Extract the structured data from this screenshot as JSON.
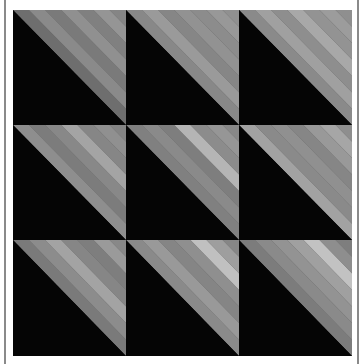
{
  "image": {
    "subject": "Quilt of half-square triangle blocks",
    "description": "3x3 grid of square blocks, each split diagonally from top-left to bottom-right; lower-left triangle solid black, upper-right triangle gray diagonal-striped fabric",
    "grid": {
      "rows": 3,
      "cols": 3
    },
    "colors": {
      "background": "#ffffff",
      "frame_line": "#8a8a8a",
      "dark_triangle": "#050505",
      "stripe_base": "#7f7f7f"
    },
    "blocks": [
      {
        "row": 1,
        "col": 1,
        "stripes": [
          "#6e6e6e",
          "#8a8a8a",
          "#7a7a7a",
          "#909090",
          "#808080",
          "#959595",
          "#858585"
        ]
      },
      {
        "row": 1,
        "col": 2,
        "stripes": [
          "#888888",
          "#9a9a9a",
          "#868686",
          "#929292",
          "#8c8c8c",
          "#989898",
          "#909090"
        ]
      },
      {
        "row": 1,
        "col": 3,
        "stripes": [
          "#8a8a8a",
          "#a0a0a0",
          "#8e8e8e",
          "#a8a8a8",
          "#939393",
          "#9c9c9c",
          "#8f8f8f"
        ]
      },
      {
        "row": 2,
        "col": 1,
        "stripes": [
          "#8e8e8e",
          "#7c7c7c",
          "#888888",
          "#a4a4a4",
          "#868686",
          "#909090",
          "#848484"
        ]
      },
      {
        "row": 2,
        "col": 2,
        "stripes": [
          "#808080",
          "#8a8a8a",
          "#7e7e7e",
          "#b5b5b5",
          "#8c8c8c",
          "#969696",
          "#888888"
        ]
      },
      {
        "row": 2,
        "col": 3,
        "stripes": [
          "#a2a2a2",
          "#8a8a8a",
          "#909090",
          "#868686",
          "#999999",
          "#a6a6a6",
          "#8e8e8e"
        ]
      },
      {
        "row": 3,
        "col": 1,
        "stripes": [
          "#7a7a7a",
          "#8c8c8c",
          "#a3a3a3",
          "#868686",
          "#7e7e7e",
          "#9a9a9a",
          "#888888"
        ]
      },
      {
        "row": 3,
        "col": 2,
        "stripes": [
          "#8a8a8a",
          "#999999",
          "#858585",
          "#8f8f8f",
          "#c0c0c0",
          "#9e9e9e",
          "#868686"
        ]
      },
      {
        "row": 3,
        "col": 3,
        "stripes": [
          "#7c7c7c",
          "#8a8a8a",
          "#939393",
          "#a0a0a0",
          "#c2c2c2",
          "#8e8e8e",
          "#7e7e7e"
        ]
      }
    ]
  }
}
